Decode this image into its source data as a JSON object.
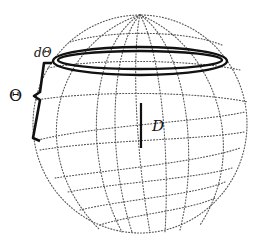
{
  "figure": {
    "labels": {
      "ring_width": "dΘ",
      "polar_angle": "Θ",
      "diameter": "D"
    },
    "colors": {
      "grid": "#555555",
      "ring": "#111111",
      "brace": "#111111",
      "background": "#ffffff"
    },
    "sphere": {
      "center_x": 140,
      "center_y": 124,
      "radius": 108,
      "parallels": 7,
      "meridians": 8
    }
  }
}
